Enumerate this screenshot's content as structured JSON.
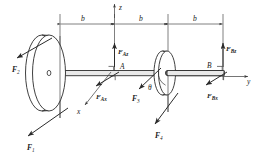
{
  "figure": {
    "axes": [
      {
        "name": "z",
        "label": "z",
        "direction": "up"
      },
      {
        "name": "y",
        "label": "y",
        "direction": "right"
      },
      {
        "name": "x",
        "label": "x",
        "direction": "down-left"
      }
    ],
    "dimensions": [
      {
        "id": "seg1",
        "label": "b"
      },
      {
        "id": "seg2",
        "label": "b"
      },
      {
        "id": "seg3",
        "label": "b"
      }
    ],
    "bearings": [
      {
        "id": "A",
        "label": "A"
      },
      {
        "id": "B",
        "label": "B"
      }
    ],
    "angles": [
      {
        "id": "theta",
        "label": "θ"
      }
    ],
    "forces": [
      {
        "id": "F1",
        "base": "F",
        "sub": "1",
        "direction": "down-left"
      },
      {
        "id": "F2",
        "base": "F",
        "sub": "2",
        "direction": "up-left"
      },
      {
        "id": "F3",
        "base": "F",
        "sub": "3",
        "direction": "down-left"
      },
      {
        "id": "F4",
        "base": "F",
        "sub": "4",
        "direction": "down-left"
      },
      {
        "id": "FAz",
        "base": "F",
        "sub": "Az",
        "direction": "up"
      },
      {
        "id": "FAx",
        "base": "F",
        "sub": "Ax",
        "direction": "down-left"
      },
      {
        "id": "FBz",
        "base": "F",
        "sub": "Bz",
        "direction": "up"
      },
      {
        "id": "FBx",
        "base": "F",
        "sub": "Bx",
        "direction": "down-left"
      }
    ]
  },
  "colors": {
    "line": "#2b2b2b",
    "thin_line": "#3a3a3a",
    "shaft_fill": "#e9e9e9",
    "background": "#ffffff",
    "text": "#1a1a1a"
  }
}
